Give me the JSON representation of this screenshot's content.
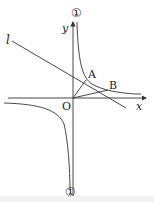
{
  "labels": {
    "y_axis": "y",
    "x_axis": "x",
    "origin": "O",
    "line": "l",
    "point_a": "A",
    "point_b": "B",
    "curve_top": "①",
    "curve_bottom": "①"
  },
  "colors": {
    "stroke": "#333333",
    "text": "#222222"
  }
}
